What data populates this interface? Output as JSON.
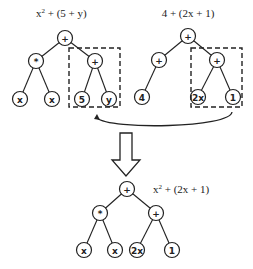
{
  "diagram": {
    "type": "expression-tree-crossover",
    "trees": [
      {
        "id": "parent1",
        "expression": {
          "base": "x",
          "sup": "2",
          "rest": " + (5 + y)"
        },
        "nodes": [
          {
            "id": "p1-root",
            "label": "+",
            "x": 65,
            "y": 38
          },
          {
            "id": "p1-mul",
            "label": "*",
            "x": 36,
            "y": 61
          },
          {
            "id": "p1-add",
            "label": "+",
            "x": 95,
            "y": 61
          },
          {
            "id": "p1-x1",
            "label": "x",
            "x": 20,
            "y": 99
          },
          {
            "id": "p1-x2",
            "label": "x",
            "x": 52,
            "y": 99
          },
          {
            "id": "p1-5",
            "label": "5",
            "x": 82,
            "y": 99
          },
          {
            "id": "p1-y",
            "label": "y",
            "x": 109,
            "y": 99
          }
        ],
        "edges": [
          [
            "p1-root",
            "p1-mul"
          ],
          [
            "p1-root",
            "p1-add"
          ],
          [
            "p1-mul",
            "p1-x1"
          ],
          [
            "p1-mul",
            "p1-x2"
          ],
          [
            "p1-add",
            "p1-5"
          ],
          [
            "p1-add",
            "p1-y"
          ]
        ],
        "highlight_box": {
          "x": 69,
          "y": 48,
          "w": 51,
          "h": 59
        }
      },
      {
        "id": "parent2",
        "expression": {
          "base": "4 + (2x + 1)",
          "sup": "",
          "rest": ""
        },
        "nodes": [
          {
            "id": "p2-root",
            "label": "+",
            "x": 188,
            "y": 36
          },
          {
            "id": "p2-left",
            "label": "+",
            "x": 159,
            "y": 60
          },
          {
            "id": "p2-right",
            "label": "+",
            "x": 217,
            "y": 60
          },
          {
            "id": "p2-4",
            "label": "4",
            "x": 142,
            "y": 97
          },
          {
            "id": "p2-2x",
            "label": "2x",
            "x": 198,
            "y": 97
          },
          {
            "id": "p2-1",
            "label": "1",
            "x": 233,
            "y": 97
          }
        ],
        "edges": [
          [
            "p2-root",
            "p2-left"
          ],
          [
            "p2-root",
            "p2-right"
          ],
          [
            "p2-left",
            "p2-4"
          ],
          [
            "p2-right",
            "p2-2x"
          ],
          [
            "p2-right",
            "p2-1"
          ]
        ],
        "highlight_box": {
          "x": 191,
          "y": 48,
          "w": 51,
          "h": 59
        }
      },
      {
        "id": "offspring",
        "expression": {
          "base": "x",
          "sup": "2",
          "rest": " + (2x + 1)"
        },
        "nodes": [
          {
            "id": "c-root",
            "label": "+",
            "x": 127,
            "y": 189
          },
          {
            "id": "c-mul",
            "label": "*",
            "x": 100,
            "y": 213
          },
          {
            "id": "c-add",
            "label": "+",
            "x": 156,
            "y": 213
          },
          {
            "id": "c-x1",
            "label": "x",
            "x": 84,
            "y": 250
          },
          {
            "id": "c-x2",
            "label": "x",
            "x": 115,
            "y": 250
          },
          {
            "id": "c-2x",
            "label": "2x",
            "x": 137,
            "y": 250
          },
          {
            "id": "c-1",
            "label": "1",
            "x": 172,
            "y": 250
          }
        ],
        "edges": [
          [
            "c-root",
            "c-mul"
          ],
          [
            "c-root",
            "c-add"
          ],
          [
            "c-mul",
            "c-x1"
          ],
          [
            "c-mul",
            "c-x2"
          ],
          [
            "c-add",
            "c-2x"
          ],
          [
            "c-add",
            "c-1"
          ]
        ]
      }
    ],
    "labels": {
      "parent1_base": "x",
      "parent1_sup": "2",
      "parent1_rest": " + (5 + y)",
      "parent2_text": "4 + (2x + 1)",
      "offspring_base": "x",
      "offspring_sup": "2",
      "offspring_rest": " + (2x + 1)"
    },
    "node_labels": {
      "p1_root": "+",
      "p1_mul": "*",
      "p1_add": "+",
      "p1_x1": "x",
      "p1_x2": "x",
      "p1_5": "5",
      "p1_y": "y",
      "p2_root": "+",
      "p2_left": "+",
      "p2_right": "+",
      "p2_4": "4",
      "p2_2x": "2x",
      "p2_1": "1",
      "c_root": "+",
      "c_mul": "*",
      "c_add": "+",
      "c_x1": "x",
      "c_x2": "x",
      "c_2x": "2x",
      "c_1": "1"
    },
    "arrows": [
      {
        "id": "swap-arrow",
        "kind": "curved",
        "meaning": "subtree from parent2 replaces subtree in parent1"
      },
      {
        "id": "result-arrow",
        "kind": "block-down",
        "meaning": "produces offspring"
      }
    ],
    "colors": {
      "stroke": "#222222",
      "background": "#ffffff"
    }
  }
}
